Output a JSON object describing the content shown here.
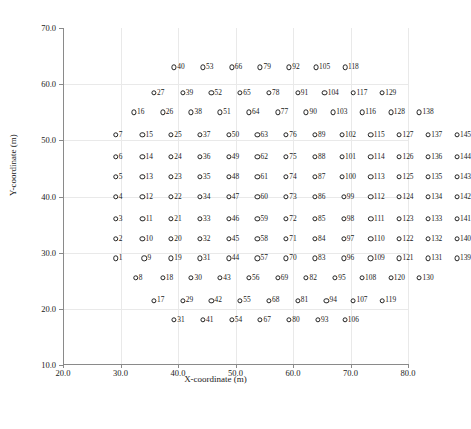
{
  "chart_data": {
    "type": "scatter",
    "title": "",
    "xlabel": "X-coordinate (m)",
    "ylabel": "Y-coordinate (m)",
    "xlim": [
      20.0,
      80.0
    ],
    "ylim": [
      10.0,
      70.0
    ],
    "xticks": [
      "20.0",
      "30.0",
      "40.0",
      "50.0",
      "60.0",
      "70.0",
      "80.0"
    ],
    "xtick_values": [
      20.0,
      30.0,
      40.0,
      50.0,
      60.0,
      70.0,
      80.0
    ],
    "yticks": [
      "70.0",
      "60.0",
      "50.0",
      "40.0",
      "30.0",
      "20.0",
      "10.0"
    ],
    "ytick_values": [
      70.0,
      60.0,
      50.0,
      40.0,
      30.0,
      20.0,
      10.0
    ],
    "grid": true,
    "legend": "none",
    "marker": "open-circle",
    "marker_color": "#222222",
    "marker_fill": "#ffffff",
    "point_label_position": "right-of-marker",
    "rows": [
      {
        "y": 63.0,
        "x_start": 40.0,
        "x_step": 5.0,
        "labels": [
          "40",
          "53",
          "66",
          "79",
          "92",
          "105",
          "118"
        ]
      },
      {
        "y": 58.5,
        "x_start": 36.5,
        "x_step": 5.0,
        "labels": [
          "27",
          "39",
          "52",
          "65",
          "78",
          "91",
          "104",
          "117",
          "129"
        ]
      },
      {
        "y": 55.0,
        "x_start": 33.0,
        "x_step": 5.0,
        "labels": [
          "16",
          "26",
          "38",
          "51",
          "64",
          "77",
          "90",
          "103",
          "116",
          "128",
          "138"
        ]
      },
      {
        "y": 51.0,
        "x_start": 29.5,
        "x_step": 5.0,
        "labels": [
          "7",
          "15",
          "25",
          "37",
          "50",
          "63",
          "76",
          "89",
          "102",
          "115",
          "127",
          "137",
          "145"
        ]
      },
      {
        "y": 47.0,
        "x_start": 29.5,
        "x_step": 5.0,
        "labels": [
          "6",
          "14",
          "24",
          "36",
          "49",
          "62",
          "75",
          "88",
          "101",
          "114",
          "126",
          "136",
          "144"
        ]
      },
      {
        "y": 43.5,
        "x_start": 29.5,
        "x_step": 5.0,
        "labels": [
          "5",
          "13",
          "23",
          "35",
          "48",
          "61",
          "74",
          "87",
          "100",
          "113",
          "125",
          "135",
          "143"
        ]
      },
      {
        "y": 40.0,
        "x_start": 29.5,
        "x_step": 5.0,
        "labels": [
          "4",
          "12",
          "22",
          "34",
          "47",
          "60",
          "73",
          "86",
          "99",
          "112",
          "124",
          "134",
          "142"
        ]
      },
      {
        "y": 36.0,
        "x_start": 29.5,
        "x_step": 5.0,
        "labels": [
          "3",
          "11",
          "21",
          "33",
          "46",
          "59",
          "72",
          "85",
          "98",
          "111",
          "123",
          "133",
          "141"
        ]
      },
      {
        "y": 32.5,
        "x_start": 29.5,
        "x_step": 5.0,
        "labels": [
          "2",
          "10",
          "20",
          "32",
          "45",
          "58",
          "71",
          "84",
          "97",
          "110",
          "122",
          "132",
          "140"
        ]
      },
      {
        "y": 29.0,
        "x_start": 29.5,
        "x_step": 5.0,
        "labels": [
          "1",
          "9",
          "19",
          "31",
          "44",
          "57",
          "70",
          "83",
          "96",
          "109",
          "121",
          "131",
          "139"
        ]
      },
      {
        "y": 25.5,
        "x_start": 33.0,
        "x_step": 5.0,
        "labels": [
          "8",
          "18",
          "30",
          "43",
          "56",
          "69",
          "82",
          "95",
          "108",
          "120",
          "130"
        ]
      },
      {
        "y": 21.5,
        "x_start": 36.5,
        "x_step": 5.0,
        "labels": [
          "17",
          "29",
          "42",
          "55",
          "68",
          "81",
          "94",
          "107",
          "119"
        ]
      },
      {
        "y": 18.0,
        "x_start": 40.0,
        "x_step": 5.0,
        "labels": [
          "31",
          "41",
          "54",
          "67",
          "80",
          "93",
          "106"
        ]
      }
    ]
  }
}
